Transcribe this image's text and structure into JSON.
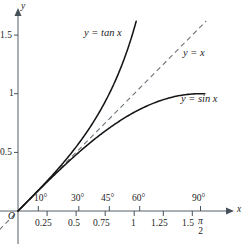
{
  "figure": {
    "type": "math-graph",
    "background": "#ffffff",
    "ink_color": "#1d1d1d",
    "axes": {
      "x_axis_label": "x",
      "y_axis_label": "y",
      "origin_label": "O",
      "origin_px": [
        18,
        211
      ],
      "x_unit_px": 116.2,
      "y_unit_px": 117.3,
      "x_range": [
        -0.16,
        1.95
      ],
      "y_range": [
        -0.28,
        1.72
      ],
      "arrows": [
        "x",
        "y"
      ]
    },
    "y_ticks": [
      {
        "value": 0.5,
        "label": "0.5"
      },
      {
        "value": 1,
        "label": "1"
      },
      {
        "value": 1.5,
        "label": "1.5"
      }
    ],
    "x_ticks": [
      {
        "value": 0.25,
        "label": "0.25"
      },
      {
        "value": 0.5,
        "label": "0.5"
      },
      {
        "value": 0.75,
        "label": "0.75"
      },
      {
        "value": 1,
        "label": "1"
      },
      {
        "value": 1.25,
        "label": "1.25"
      },
      {
        "value": 1.5,
        "label": "1.5"
      }
    ],
    "degree_ticks": [
      {
        "value": 0.1745,
        "label": "10°"
      },
      {
        "value": 0.5236,
        "label": "30°"
      },
      {
        "value": 0.7854,
        "label": "45°"
      },
      {
        "value": 1.0472,
        "label": "60°"
      },
      {
        "value": 1.5708,
        "label": "90°"
      }
    ],
    "pi_over_two": {
      "numerator": "π",
      "denominator": "2",
      "at_value": 1.5708
    },
    "curves": [
      {
        "name": "tangent",
        "label": "y = tan x",
        "style": "solid",
        "label_px": [
          85,
          28
        ],
        "domain": [
          0,
          1.02
        ]
      },
      {
        "name": "identity",
        "label": "y = x",
        "style": "dashed",
        "label_px": [
          184,
          48
        ],
        "domain": [
          -0.16,
          1.62
        ]
      },
      {
        "name": "sine",
        "label": "y = sin x",
        "style": "solid",
        "label_px": [
          182,
          94
        ],
        "domain": [
          0,
          1.66
        ]
      }
    ]
  }
}
